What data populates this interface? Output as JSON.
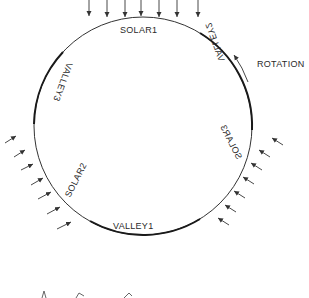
{
  "diagram": {
    "type": "planet-rotation-insolation",
    "colors": {
      "line": "#333333",
      "thick_line": "#1a1a1a",
      "text": "#2a2a2a",
      "background": "#ffffff"
    },
    "labels": {
      "solar1": "SOLAR1",
      "solar2": "SOLAR2",
      "solar3": "SOLAR3",
      "valley1": "VALLEY1",
      "valley2": "VALLEY2",
      "valley3": "VALLEY3",
      "rotation": "ROTATION"
    },
    "sun_ray_groups": [
      {
        "name": "top",
        "count": 7,
        "direction": "down"
      },
      {
        "name": "lower-left",
        "count": 7,
        "direction": "up-right"
      },
      {
        "name": "lower-right",
        "count": 7,
        "direction": "up-left"
      }
    ]
  }
}
